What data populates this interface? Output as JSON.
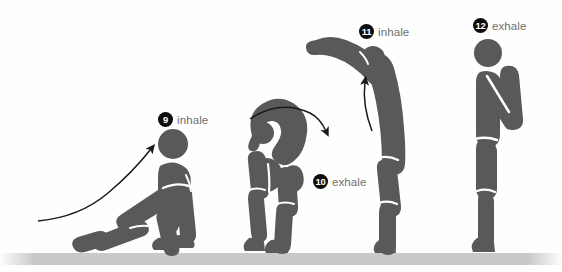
{
  "figure": {
    "colors": {
      "figure_fill": "#595959",
      "ground": "#c9c9c9",
      "background": "#fefefe",
      "badge_bg": "#0d0d0d",
      "badge_text": "#ffffff",
      "label_text": "#6e6e6e",
      "arrow": "#1a1a1a"
    }
  },
  "steps": [
    {
      "number": "9",
      "breath": "inhale",
      "pose": "low-lunge",
      "label_x": 158,
      "label_y": 112
    },
    {
      "number": "10",
      "breath": "exhale",
      "pose": "standing-forward-fold",
      "label_x": 313,
      "label_y": 174
    },
    {
      "number": "11",
      "breath": "inhale",
      "pose": "half-lift-arms-forward",
      "label_x": 359,
      "label_y": 24
    },
    {
      "number": "12",
      "breath": "exhale",
      "pose": "standing-prayer",
      "label_x": 473,
      "label_y": 18
    }
  ],
  "arrows": [
    {
      "name": "arrow-to-step-9",
      "direction": "up-right"
    },
    {
      "name": "arrow-over-step-10",
      "direction": "clockwise-arc"
    },
    {
      "name": "arrow-to-step-11",
      "direction": "up"
    }
  ],
  "ground": {
    "name": "ground-line",
    "y": 253,
    "height": 12
  }
}
